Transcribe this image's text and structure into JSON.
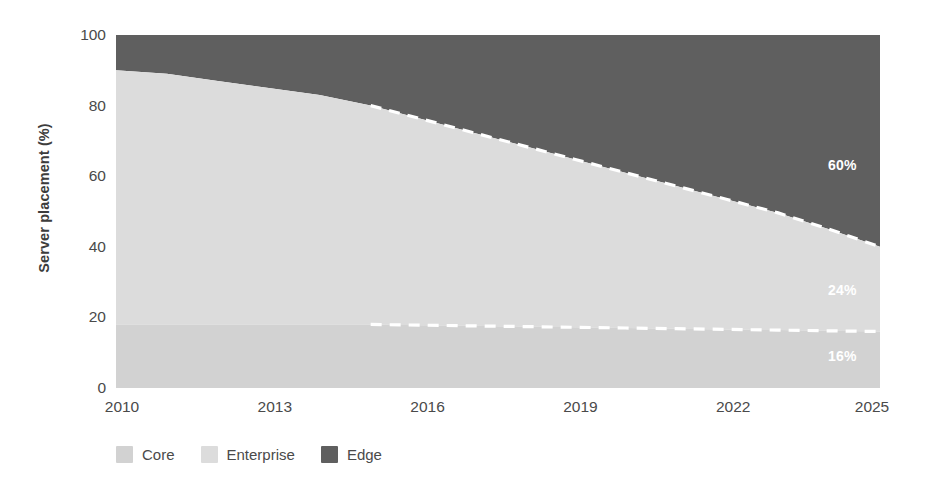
{
  "chart_data": {
    "type": "area",
    "title": "",
    "subtitle": "",
    "xlabel": "",
    "ylabel": "Server placement (%)",
    "xlim": [
      2010,
      2025
    ],
    "ylim": [
      0,
      100
    ],
    "grid": false,
    "stacked": true,
    "stack_order": [
      "Core",
      "Enterprise",
      "Edge"
    ],
    "legend_position": "bottom-left",
    "x": [
      2010,
      2011,
      2012,
      2013,
      2014,
      2015,
      2016,
      2017,
      2018,
      2019,
      2020,
      2021,
      2022,
      2023,
      2024,
      2025
    ],
    "x_ticks": [
      "2010",
      "2013",
      "2016",
      "2019",
      "2022",
      "2025"
    ],
    "x_tick_values": [
      2010,
      2013,
      2016,
      2019,
      2022,
      2025
    ],
    "y_ticks": [
      "0",
      "20",
      "40",
      "60",
      "80",
      "100"
    ],
    "y_tick_values": [
      0,
      20,
      40,
      60,
      80,
      100
    ],
    "series": [
      {
        "name": "Core",
        "color": "#d2d2d2",
        "values": [
          18,
          18,
          18,
          18,
          18,
          18,
          17.8,
          17.6,
          17.4,
          17.2,
          17.0,
          16.8,
          16.6,
          16.4,
          16.2,
          16
        ],
        "end_label": "16%"
      },
      {
        "name": "Enterprise",
        "color": "#dcdcdc",
        "values": [
          72,
          71,
          69,
          67,
          65,
          62,
          58.4,
          54.8,
          51.2,
          47.6,
          44.0,
          40.4,
          36.8,
          33.2,
          28.8,
          24
        ],
        "end_label": "24%"
      },
      {
        "name": "Edge",
        "color": "#5f5f5f",
        "values": [
          10,
          11,
          13,
          15,
          17,
          20,
          23.8,
          27.6,
          31.4,
          35.2,
          39.0,
          42.8,
          46.6,
          50.4,
          55.0,
          60
        ],
        "end_label": "60%"
      }
    ],
    "cumulative_boundaries": {
      "core_top": [
        18,
        18,
        18,
        18,
        18,
        18,
        17.8,
        17.6,
        17.4,
        17.2,
        17.0,
        16.8,
        16.6,
        16.4,
        16.2,
        16
      ],
      "enterprise_top": [
        90,
        89,
        87,
        85,
        83,
        80,
        76.2,
        72.4,
        68.6,
        64.8,
        61.0,
        57.2,
        53.4,
        49.6,
        45.0,
        40
      ]
    },
    "forecast": {
      "starts_at_x": 2015,
      "line_style": "dashed",
      "line_color": "#ffffff",
      "note": "white dashed boundary lines from 2015 to 2025"
    },
    "annotations": [
      {
        "text": "60%",
        "series": "Edge",
        "x": 2024,
        "y": 70
      },
      {
        "text": "24%",
        "series": "Enterprise",
        "x": 2024,
        "y": 28
      },
      {
        "text": "16%",
        "series": "Core",
        "x": 2024,
        "y": 8
      }
    ]
  },
  "legend": {
    "items": [
      {
        "label": "Core",
        "color": "#d2d2d2"
      },
      {
        "label": "Enterprise",
        "color": "#dcdcdc"
      },
      {
        "label": "Edge",
        "color": "#5f5f5f"
      }
    ]
  },
  "axes": {
    "y_title": "Server placement (%)",
    "y_labels": [
      "100",
      "80",
      "60",
      "40",
      "20",
      "0"
    ],
    "x_labels": [
      "2010",
      "2013",
      "2016",
      "2019",
      "2022",
      "2025"
    ]
  },
  "value_labels": {
    "edge": "60%",
    "enterprise": "24%",
    "core": "16%"
  }
}
